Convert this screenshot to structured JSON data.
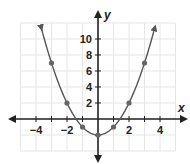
{
  "chart_data": {
    "type": "line",
    "title": "",
    "xlabel": "x",
    "ylabel": "y",
    "function": "y = x^2 - 2",
    "x_ticks": [
      -4,
      -2,
      2,
      4
    ],
    "y_ticks": [
      2,
      4,
      6,
      8,
      10
    ],
    "xlim": [
      -5,
      5
    ],
    "ylim": [
      -4,
      12
    ],
    "grid": true,
    "grid_step_x": 1,
    "grid_step_y": 2,
    "points": [
      {
        "x": -3,
        "y": 7
      },
      {
        "x": -2,
        "y": 2
      },
      {
        "x": -1,
        "y": -1
      },
      {
        "x": 0,
        "y": -2
      },
      {
        "x": 1,
        "y": -1
      },
      {
        "x": 2,
        "y": 2
      },
      {
        "x": 3,
        "y": 7
      }
    ],
    "curve_color": "#555555",
    "point_color": "#666666",
    "axis_color": "#222222",
    "grid_color": "#e6e6e6"
  },
  "labels": {
    "x_axis": "x",
    "y_axis": "y",
    "x_tick_labels": [
      "−4",
      "−2",
      "2",
      "4"
    ],
    "y_tick_labels": [
      "10",
      "8",
      "6",
      "4",
      "2"
    ]
  }
}
